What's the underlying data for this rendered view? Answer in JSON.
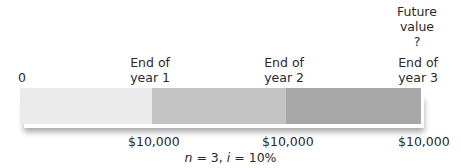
{
  "diagram": {
    "start_label": "0",
    "periods": [
      {
        "label_line1": "End of",
        "label_line2": "year 1",
        "amount": "$10,000"
      },
      {
        "label_line1": "End of",
        "label_line2": "year 2",
        "amount": "$10,000"
      },
      {
        "label_line1": "End of",
        "label_line2": "year 3",
        "amount": "$10,000"
      }
    ],
    "future_value": {
      "line1": "Future",
      "line2": "value",
      "line3": "?"
    },
    "segment_colors": [
      "#ebebeb",
      "#c4c4c4",
      "#a8a8a8"
    ],
    "note_n": "n",
    "note_eq1": " = 3, ",
    "note_i": "i",
    "note_eq2": " = 10%"
  }
}
